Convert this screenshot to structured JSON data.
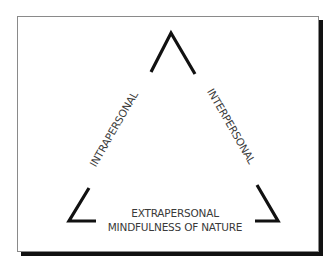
{
  "diagram": {
    "type": "triangle",
    "labels": {
      "left_side": "INTRAPERSONAL",
      "right_side": "INTERPERSONAL",
      "bottom_line1": "EXTRAPERSONAL",
      "bottom_line2": "MINDFULNESS OF NATURE"
    },
    "colors": {
      "stroke": "#111111",
      "text": "#3a3a3a",
      "frame_border": "#8a8a8a",
      "shadow": "#111111",
      "background": "#ffffff"
    }
  }
}
